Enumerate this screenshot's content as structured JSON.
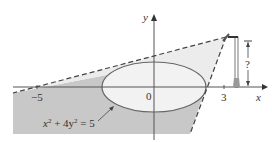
{
  "diagram": {
    "axes": {
      "x_label": "x",
      "y_label": "y",
      "origin_label": "0",
      "tick_neg5": "−5",
      "tick_3": "3"
    },
    "ellipse": {
      "equation_lhs": "x",
      "equation": "x² + 4y² = 5",
      "eq_part1": "x",
      "eq_sup1": "2",
      "eq_part2": " + 4y",
      "eq_sup2": "2",
      "eq_part3": " = 5"
    },
    "lamp": {
      "height_label": "?"
    },
    "colors": {
      "shadow": "#c8c8c8",
      "light": "#ececec",
      "ellipse_fill": "#f2f2f2",
      "line": "#555555"
    }
  }
}
